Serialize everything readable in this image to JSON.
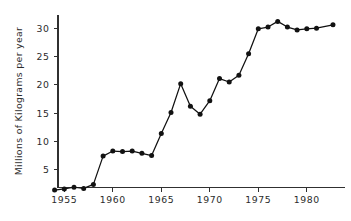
{
  "chart_data": {
    "type": "line",
    "title": "",
    "subtitle": "",
    "xlabel": "",
    "ylabel": "Millions of Kilograms per year",
    "xlim": [
      1953.4,
      1983.4
    ],
    "ylim": [
      0,
      32.5
    ],
    "xticks": [
      1955,
      1960,
      1965,
      1970,
      1975,
      1980
    ],
    "xticklabels": [
      "1955",
      "1960",
      "1965",
      "1970",
      "1975",
      "1980"
    ],
    "yticks": [
      5,
      10,
      15,
      20,
      25,
      30
    ],
    "yticklabels": [
      "5",
      "10",
      "15",
      "20",
      "25",
      "30"
    ],
    "grid": false,
    "legend": null,
    "legend_position": "none",
    "marker": "filled-circle",
    "line_color": "#111111",
    "marker_color": "#121212",
    "axis_color": "#303030",
    "background_color": "#ffffff",
    "x": [
      1954,
      1955,
      1956,
      1957,
      1958,
      1959,
      1960,
      1961,
      1962,
      1963,
      1964,
      1965,
      1966,
      1967,
      1968,
      1969,
      1970,
      1971,
      1972,
      1973,
      1974,
      1975,
      1976,
      1977,
      1978,
      1979,
      1980,
      1981,
      1982.7
    ],
    "values": [
      1.4,
      1.6,
      1.9,
      1.7,
      2.4,
      7.4,
      8.3,
      8.2,
      8.3,
      7.9,
      7.5,
      11.4,
      15.1,
      20.2,
      16.2,
      14.8,
      17.2,
      21.1,
      20.5,
      21.7,
      25.5,
      29.9,
      30.2,
      31.2,
      30.2,
      29.7,
      29.9,
      30.0,
      30.6
    ],
    "series": [
      {
        "name": "Millions of Kilograms per year",
        "values": [
          1.4,
          1.6,
          1.9,
          1.7,
          2.4,
          7.4,
          8.3,
          8.2,
          8.3,
          7.9,
          7.5,
          11.4,
          15.1,
          20.2,
          16.2,
          14.8,
          17.2,
          21.1,
          20.5,
          21.7,
          25.5,
          29.9,
          30.2,
          31.2,
          30.2,
          29.7,
          29.9,
          30.0,
          30.6
        ]
      }
    ],
    "annotations": []
  },
  "geometry": {
    "x_axis_y": 187.5,
    "y_axis_x": 58.0,
    "x_axis_right": 345.0,
    "y_axis_top": 15.0,
    "px_per_year": 9.7,
    "x_ref_year": 1955,
    "x_ref_px": 64.3,
    "px_per_unit": 5.66,
    "y_ref_value": 5,
    "y_ref_px": 169.7,
    "tick_len_x": 4.5,
    "tick_len_y": 4.5,
    "marker_radius": 2.5
  }
}
